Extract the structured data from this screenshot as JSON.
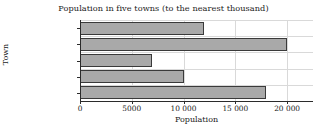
{
  "chart_data": {
    "type": "bar",
    "orientation": "horizontal",
    "title": "Population in five towns (to the nearest thousand)",
    "xlabel": "Population",
    "ylabel": "Town",
    "categories": [
      "Faversham",
      "Castle Hill",
      "Brotton",
      "Backley",
      "Berkhampton"
    ],
    "values": [
      12000,
      20000,
      7000,
      10000,
      18000
    ],
    "xlim": [
      0,
      22500
    ],
    "ylim": [
      0,
      5
    ],
    "xticks": [
      0,
      5000,
      10000,
      15000,
      20000
    ],
    "xtick_labels": [
      "0",
      "5000",
      "10 000",
      "15 000",
      "20 000"
    ],
    "grid": true,
    "grid_axis": "both",
    "legend": "none",
    "bar_color": "#a9a9a9",
    "bar_edge_color": "#3a3a3a",
    "grid_color": "#d9d9d9",
    "axis_color": "#2b2b2b",
    "background": "#ffffff"
  }
}
